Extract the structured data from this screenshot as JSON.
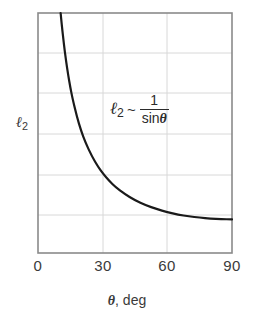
{
  "chart_data": {
    "type": "line",
    "title": "",
    "subtitle": "",
    "xlabel": "θ, deg",
    "ylabel": "ℓ2",
    "ylabel_base": "ℓ",
    "ylabel_sub": "2",
    "xlim": [
      0,
      90
    ],
    "ylim": [
      0,
      1
    ],
    "grid": true,
    "legend": null,
    "xticks": [
      {
        "value": 0,
        "label": "0"
      },
      {
        "value": 30,
        "label": "30"
      },
      {
        "value": 60,
        "label": "60"
      },
      {
        "value": 90,
        "label": "90"
      }
    ],
    "yticks": [],
    "x_gridlines": [
      30,
      60
    ],
    "y_gridlines": [
      0.172,
      0.338,
      0.504,
      0.678,
      0.844
    ],
    "annotations": [
      {
        "name": "curve-formula",
        "text": "ℓ2 ~ 1/sinθ",
        "lhs_base": "ℓ",
        "lhs_sub": "2",
        "relation": "~",
        "numerator": "1",
        "denominator_fn": "sin",
        "denominator_var": "θ",
        "x_deg": 44,
        "y_frac": 0.62
      }
    ],
    "series": [
      {
        "name": "l2 proportional to 1/sin(theta)",
        "relation": "l2 = k / sin(theta)",
        "x": [
          10.5,
          11,
          12,
          13,
          14,
          15,
          16,
          18,
          20,
          22,
          25,
          28,
          30,
          33,
          36,
          40,
          45,
          50,
          55,
          60,
          65,
          70,
          75,
          80,
          85,
          90
        ],
        "y": [
          1.0,
          0.955,
          0.877,
          0.811,
          0.754,
          0.705,
          0.662,
          0.59,
          0.533,
          0.487,
          0.432,
          0.389,
          0.365,
          0.335,
          0.31,
          0.284,
          0.258,
          0.238,
          0.223,
          0.211,
          0.201,
          0.194,
          0.189,
          0.185,
          0.183,
          0.182
        ],
        "color": "#1a1a1a",
        "linewidth": 2.2,
        "asymptote_note": "diverges as theta approaches 0; flattens toward a constant near 90 deg"
      }
    ],
    "style": {
      "frame_color": "#8a8a8a",
      "grid_color": "#d8d8d8",
      "curve_color": "#1a1a1a",
      "text_color": "#3a3a3a",
      "background": "#ffffff"
    }
  }
}
